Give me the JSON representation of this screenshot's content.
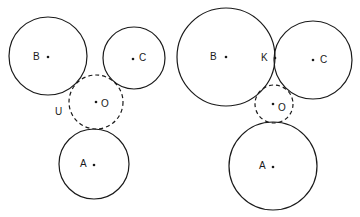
{
  "diagram": {
    "left": {
      "circles": [
        {
          "id": "B",
          "label": "B",
          "cx": 48,
          "cy": 56,
          "r": 39,
          "dashed": false,
          "label_x": 33,
          "label_y": 60,
          "dot_x": 48,
          "dot_y": 57
        },
        {
          "id": "C",
          "label": "C",
          "cx": 134,
          "cy": 58,
          "r": 31,
          "dashed": false,
          "label_x": 139,
          "label_y": 61,
          "dot_x": 133,
          "dot_y": 59
        },
        {
          "id": "O",
          "label": "O",
          "cx": 96,
          "cy": 102,
          "r": 27,
          "dashed": true,
          "label_x": 101,
          "label_y": 107,
          "dot_x": 96,
          "dot_y": 102
        },
        {
          "id": "A",
          "label": "A",
          "cx": 94,
          "cy": 164,
          "r": 35,
          "dashed": false,
          "label_x": 80,
          "label_y": 167,
          "dot_x": 94,
          "dot_y": 165
        }
      ],
      "extra_labels": [
        {
          "id": "U",
          "label": "U",
          "x": 55,
          "y": 115
        }
      ]
    },
    "right": {
      "circles": [
        {
          "id": "B",
          "label": "B",
          "cx": 226,
          "cy": 57,
          "r": 49,
          "dashed": false,
          "label_x": 210,
          "label_y": 60,
          "dot_x": 226,
          "dot_y": 57
        },
        {
          "id": "C",
          "label": "C",
          "cx": 313,
          "cy": 60,
          "r": 39,
          "dashed": false,
          "label_x": 320,
          "label_y": 63,
          "dot_x": 313,
          "dot_y": 60
        },
        {
          "id": "O",
          "label": "O",
          "cx": 274,
          "cy": 104,
          "r": 19,
          "dashed": true,
          "label_x": 278,
          "label_y": 111,
          "dot_x": 273,
          "dot_y": 104
        },
        {
          "id": "A",
          "label": "A",
          "cx": 273,
          "cy": 166,
          "r": 44,
          "dashed": false,
          "label_x": 259,
          "label_y": 169,
          "dot_x": 273,
          "dot_y": 167
        }
      ],
      "extra_labels": [
        {
          "id": "K",
          "label": "K",
          "x": 261,
          "y": 61
        }
      ],
      "extra_points": [
        {
          "id": "K-point",
          "x": 275,
          "y": 58
        }
      ]
    }
  }
}
